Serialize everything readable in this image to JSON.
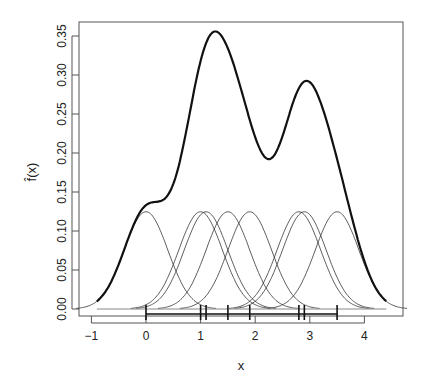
{
  "chart_data": {
    "type": "line",
    "title": "",
    "xlabel": "x",
    "ylabel": "f̂(x)",
    "xlim": [
      -1.1,
      4.6
    ],
    "ylim": [
      0,
      0.37
    ],
    "x_ticks": [
      -1,
      0,
      1,
      2,
      3,
      4
    ],
    "y_ticks": [
      "0.00",
      "0.05",
      "0.10",
      "0.15",
      "0.20",
      "0.25",
      "0.30",
      "0.35"
    ],
    "grid": false,
    "legend": null,
    "observations": [
      0,
      1.0,
      1.1,
      1.5,
      1.9,
      2.8,
      2.9,
      3.5
    ],
    "kernel": "gaussian",
    "bandwidth": 0.4,
    "kernel_peak_height": 0.125,
    "series": [
      {
        "name": "kernel density estimate",
        "style": "thick black",
        "key_points": [
          [
            -0.9,
            0.005
          ],
          [
            0.05,
            0.135
          ],
          [
            1.27,
            0.354
          ],
          [
            2.25,
            0.193
          ],
          [
            2.95,
            0.291
          ],
          [
            4.4,
            0.006
          ]
        ]
      },
      {
        "name": "individual scaled kernels",
        "style": "thin black",
        "count": 8
      }
    ],
    "rug": true
  }
}
